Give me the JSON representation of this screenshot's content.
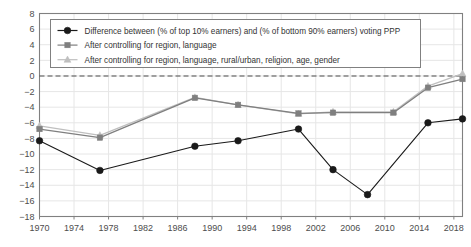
{
  "chart_data": {
    "type": "line",
    "title": "",
    "xlabel": "",
    "ylabel": "",
    "xlim": [
      1970,
      2019
    ],
    "ylim": [
      -18,
      8
    ],
    "ytick_step": 2,
    "grid": true,
    "zero_reference_line": 0,
    "legend_position": "top-left inside plot",
    "xtick_labels": [
      "1970",
      "1974",
      "1978",
      "1982",
      "1986",
      "1990",
      "1994",
      "1998",
      "2002",
      "2006",
      "2010",
      "2014",
      "2018"
    ],
    "xtick_values": [
      1970,
      1974,
      1978,
      1982,
      1986,
      1990,
      1994,
      1998,
      2002,
      2006,
      2010,
      2014,
      2018
    ],
    "ytick_labels": [
      "8",
      "6",
      "4",
      "2",
      "0",
      "−2",
      "−4",
      "−6",
      "−8",
      "−10",
      "−12",
      "−14",
      "−16",
      "−18"
    ],
    "ytick_values": [
      8,
      6,
      4,
      2,
      0,
      -2,
      -4,
      -6,
      -8,
      -10,
      -12,
      -14,
      -16,
      -18
    ],
    "x": [
      1970,
      1977,
      1988,
      1993,
      2000,
      2004,
      2008,
      2011,
      2015,
      2019
    ],
    "series": [
      {
        "name": "Difference between (% of top 10% earners) and (% of bottom 90% earners) voting PPP",
        "marker": "circle",
        "color": "#1a1a1a",
        "values": [
          -8.3,
          -12.1,
          -9.0,
          -8.3,
          -6.8,
          -12.0,
          -15.2,
          null,
          -6.0,
          -5.5
        ]
      },
      {
        "name": "After controlling for region, language",
        "marker": "square",
        "color": "#7f7f7f",
        "values": [
          -6.8,
          -7.9,
          -2.8,
          -3.7,
          -4.8,
          -4.7,
          null,
          -4.7,
          -1.5,
          -0.4
        ]
      },
      {
        "name": "After controlling for region, language, rural/urban, religion, age, gender",
        "marker": "triangle",
        "color": "#bfbfbf",
        "values": [
          -6.4,
          -7.6,
          -2.75,
          -3.7,
          -4.85,
          -4.6,
          null,
          -4.6,
          -1.3,
          0.3
        ]
      }
    ],
    "series_points": [
      {
        "name": "series1",
        "points": [
          [
            1970,
            -8.3
          ],
          [
            1977,
            -12.1
          ],
          [
            1988,
            -9.0
          ],
          [
            1993,
            -8.3
          ],
          [
            2000,
            -6.8
          ],
          [
            2004,
            -12.0
          ],
          [
            2008,
            -15.2
          ],
          [
            2015,
            -6.0
          ],
          [
            2019,
            -5.5
          ]
        ]
      },
      {
        "name": "series2",
        "points": [
          [
            1970,
            -6.8
          ],
          [
            1977,
            -7.9
          ],
          [
            1988,
            -2.8
          ],
          [
            1993,
            -3.7
          ],
          [
            2000,
            -4.8
          ],
          [
            2004,
            -4.7
          ],
          [
            2011,
            -4.7
          ],
          [
            2015,
            -1.5
          ],
          [
            2019,
            -0.4
          ]
        ]
      },
      {
        "name": "series3",
        "points": [
          [
            1970,
            -6.4
          ],
          [
            1977,
            -7.6
          ],
          [
            1988,
            -2.75
          ],
          [
            1993,
            -3.7
          ],
          [
            2000,
            -4.85
          ],
          [
            2004,
            -4.6
          ],
          [
            2011,
            -4.6
          ],
          [
            2015,
            -1.3
          ],
          [
            2019,
            0.3
          ]
        ]
      }
    ]
  },
  "legend": {
    "entries": [
      {
        "label": "Difference between (% of top 10% earners) and (% of bottom 90% earners) voting PPP",
        "marker": "circle-marker",
        "color": "#1a1a1a"
      },
      {
        "label": "After controlling for region, language",
        "marker": "square-marker",
        "color": "#7f7f7f"
      },
      {
        "label": "After controlling for region, language, rural/urban, religion, age, gender",
        "marker": "triangle-marker",
        "color": "#bfbfbf"
      }
    ]
  },
  "colors": {
    "series1": "#1a1a1a",
    "series2": "#7f7f7f",
    "series3": "#bfbfbf",
    "axis": "#808080",
    "grid": "#e6e6e6",
    "zero_line": "#4d4d4d",
    "tick_text": "#4d4d4d"
  }
}
